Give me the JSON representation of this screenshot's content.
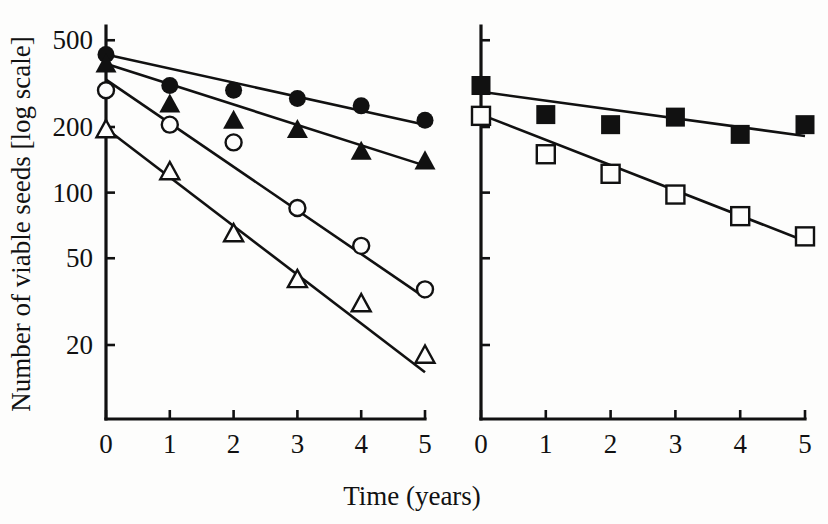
{
  "figure": {
    "title": "",
    "y_axis_label": "Number of viable seeds [log scale]",
    "x_axis_label": "Time (years)"
  },
  "chart_data": {
    "type": "line",
    "title": "",
    "xlabel": "Time (years)",
    "ylabel": "Number of viable seeds [log scale]",
    "yscale": "log",
    "ylim": [
      14,
      560
    ],
    "xlim": [
      0,
      5
    ],
    "grid": false,
    "legend": "none",
    "panels": [
      {
        "panel_id": "left-panel",
        "x": [
          0,
          1,
          2,
          3,
          4,
          5
        ],
        "x_ticks": [
          0,
          1,
          2,
          3,
          4,
          5
        ],
        "x_tick_labels": [
          "0",
          "1",
          "2",
          "3",
          "4",
          "5"
        ],
        "y_ticks": [
          500,
          200,
          100,
          50,
          20
        ],
        "y_tick_labels": [
          "500",
          "200",
          "100",
          "50",
          "20"
        ],
        "series": [
          {
            "name": "filled-circle",
            "marker": "filled-circle",
            "values": [
              430,
              310,
              295,
              270,
              250,
              215
            ],
            "fit_line": {
              "y_start": 430,
              "y_end": 205
            }
          },
          {
            "name": "filled-triangle",
            "marker": "filled-triangle",
            "values": [
              390,
              255,
              215,
              195,
              155,
              140
            ],
            "fit_line": {
              "y_start": 390,
              "y_end": 133
            }
          },
          {
            "name": "open-circle",
            "marker": "open-circle",
            "values": [
              295,
              205,
              170,
              85,
              57,
              36
            ],
            "fit_line": {
              "y_start": 330,
              "y_end": 33
            }
          },
          {
            "name": "open-triangle",
            "marker": "open-triangle",
            "values": [
              195,
              125,
              65,
              40,
              31,
              18
            ],
            "fit_line": {
              "y_start": 197,
              "y_end": 15
            }
          }
        ]
      },
      {
        "panel_id": "right-panel",
        "x": [
          0,
          1,
          2,
          3,
          4,
          5
        ],
        "x_ticks": [
          0,
          1,
          2,
          3,
          4,
          5
        ],
        "x_tick_labels": [
          "0",
          "1",
          "2",
          "3",
          "4",
          "5"
        ],
        "y_ticks": [
          500,
          200,
          100,
          50,
          20
        ],
        "y_tick_labels": [
          "",
          "",
          "",
          "",
          ""
        ],
        "series": [
          {
            "name": "filled-square",
            "marker": "filled-square",
            "values": [
              310,
              228,
              205,
              222,
              185,
              205
            ],
            "fit_line": {
              "y_start": 290,
              "y_end": 182
            }
          },
          {
            "name": "open-square",
            "marker": "open-square",
            "values": [
              225,
              150,
              122,
              98,
              78,
              63
            ],
            "fit_line": {
              "y_start": 228,
              "y_end": 60
            }
          }
        ]
      }
    ]
  },
  "geometry": {
    "left_panel": {
      "x0": 106,
      "x5": 425,
      "axis_y": 419,
      "axis_top": 26
    },
    "right_panel": {
      "x0": 481,
      "x5": 805,
      "axis_y": 419,
      "axis_top": 26
    },
    "y_pixels": {
      "500": 38,
      "200": 127,
      "100": 193,
      "50": 259,
      "20": 345
    }
  }
}
